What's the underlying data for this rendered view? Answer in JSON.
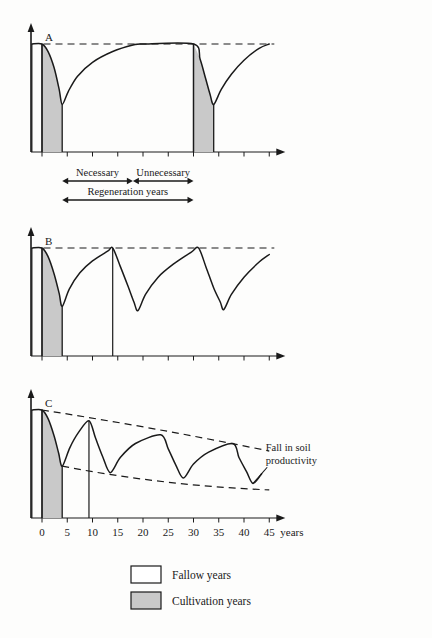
{
  "figure": {
    "title_hidden": "",
    "background_color": "#fdfdfc",
    "ink_color": "#1a1a1a",
    "cultivation_fill": "#c9c9c9"
  },
  "panels": [
    {
      "id": "A",
      "label": "A"
    },
    {
      "id": "B",
      "label": "B"
    },
    {
      "id": "C",
      "label": "C"
    }
  ],
  "annotations": {
    "necessary": "Necessary",
    "unnecessary": "Unnecessary",
    "regeneration": "Regeneration years",
    "fall_line1": "Fall in soil",
    "fall_line2": "productivity"
  },
  "axis": {
    "unit_label": "years",
    "ticks": [
      "0",
      "5",
      "10",
      "15",
      "20",
      "25",
      "30",
      "35",
      "40",
      "45"
    ],
    "tick_values": [
      0,
      5,
      10,
      15,
      20,
      25,
      30,
      35,
      40,
      45
    ]
  },
  "legend": {
    "items": [
      {
        "label": "Fallow  years",
        "swatch": "#ffffff"
      },
      {
        "label": "Cultivation  years",
        "swatch": "#c9c9c9"
      }
    ]
  },
  "chart_data": {
    "type": "line",
    "xlabel": "years",
    "ylabel": "Soil productivity",
    "xlim": [
      -2,
      47
    ],
    "ylim": [
      0,
      1.05
    ],
    "grid": false,
    "legend_position": "bottom-center",
    "panels": [
      {
        "id": "A",
        "label": "A",
        "description": "Long fallow: full regeneration reached well before the next cultivation, so part of the fallow is unnecessary.",
        "cultivation_spans": [
          [
            0,
            4
          ],
          [
            30,
            34
          ]
        ],
        "max_level_dashed_y": 1.0,
        "series": [
          {
            "name": "soil productivity",
            "points": [
              {
                "x": -2.0,
                "y": 1.0
              },
              {
                "x": 0.0,
                "y": 1.0
              },
              {
                "x": 1.2,
                "y": 0.93
              },
              {
                "x": 2.4,
                "y": 0.78
              },
              {
                "x": 3.4,
                "y": 0.58
              },
              {
                "x": 4.0,
                "y": 0.44
              },
              {
                "x": 5.2,
                "y": 0.56
              },
              {
                "x": 7.0,
                "y": 0.7
              },
              {
                "x": 10.0,
                "y": 0.83
              },
              {
                "x": 14.0,
                "y": 0.93
              },
              {
                "x": 18.0,
                "y": 0.99
              },
              {
                "x": 20.0,
                "y": 1.0
              },
              {
                "x": 30.0,
                "y": 1.0
              },
              {
                "x": 31.3,
                "y": 0.86
              },
              {
                "x": 32.4,
                "y": 0.68
              },
              {
                "x": 33.3,
                "y": 0.53
              },
              {
                "x": 34.0,
                "y": 0.44
              },
              {
                "x": 35.5,
                "y": 0.58
              },
              {
                "x": 37.5,
                "y": 0.72
              },
              {
                "x": 40.0,
                "y": 0.85
              },
              {
                "x": 43.0,
                "y": 0.96
              },
              {
                "x": 45.0,
                "y": 1.0
              }
            ]
          }
        ],
        "vertical_markers": [
          0,
          30
        ],
        "spans": [
          {
            "name": "Necessary",
            "from": 4,
            "to": 18
          },
          {
            "name": "Unnecessary",
            "from": 18,
            "to": 30
          },
          {
            "name": "Regeneration years",
            "from": 4,
            "to": 30
          }
        ]
      },
      {
        "id": "B",
        "label": "B",
        "description": "Optimum fallow: each cycle just regains full productivity before the next cultivation.",
        "cultivation_spans": [
          [
            0,
            4
          ]
        ],
        "max_level_dashed_y": 1.0,
        "series": [
          {
            "name": "soil productivity",
            "points": [
              {
                "x": -2.0,
                "y": 1.0
              },
              {
                "x": 0.0,
                "y": 1.0
              },
              {
                "x": 1.2,
                "y": 0.92
              },
              {
                "x": 2.4,
                "y": 0.76
              },
              {
                "x": 3.4,
                "y": 0.58
              },
              {
                "x": 4.0,
                "y": 0.46
              },
              {
                "x": 5.4,
                "y": 0.62
              },
              {
                "x": 7.5,
                "y": 0.77
              },
              {
                "x": 10.0,
                "y": 0.88
              },
              {
                "x": 13.0,
                "y": 0.97
              },
              {
                "x": 14.0,
                "y": 1.0
              },
              {
                "x": 15.5,
                "y": 0.83
              },
              {
                "x": 17.0,
                "y": 0.65
              },
              {
                "x": 18.2,
                "y": 0.5
              },
              {
                "x": 19.0,
                "y": 0.42
              },
              {
                "x": 20.5,
                "y": 0.57
              },
              {
                "x": 23.0,
                "y": 0.73
              },
              {
                "x": 26.0,
                "y": 0.85
              },
              {
                "x": 29.5,
                "y": 0.96
              },
              {
                "x": 31.0,
                "y": 1.0
              },
              {
                "x": 32.5,
                "y": 0.82
              },
              {
                "x": 34.0,
                "y": 0.63
              },
              {
                "x": 35.3,
                "y": 0.5
              },
              {
                "x": 36.0,
                "y": 0.43
              },
              {
                "x": 37.5,
                "y": 0.57
              },
              {
                "x": 40.0,
                "y": 0.73
              },
              {
                "x": 43.0,
                "y": 0.87
              },
              {
                "x": 45.0,
                "y": 0.94
              }
            ]
          }
        ],
        "vertical_markers": [
          0,
          14
        ]
      },
      {
        "id": "C",
        "label": "C",
        "description": "Too-short fallow: productivity never fully recovers, so both peaks and troughs decline over time.",
        "cultivation_spans": [
          [
            0,
            4
          ]
        ],
        "envelope_upper": [
          {
            "x": 0,
            "y": 1.0
          },
          {
            "x": 45,
            "y": 0.62
          }
        ],
        "envelope_lower": [
          {
            "x": 4,
            "y": 0.48
          },
          {
            "x": 45,
            "y": 0.26
          }
        ],
        "series": [
          {
            "name": "soil productivity",
            "points": [
              {
                "x": -2.0,
                "y": 1.0
              },
              {
                "x": 0.0,
                "y": 1.0
              },
              {
                "x": 1.2,
                "y": 0.92
              },
              {
                "x": 2.4,
                "y": 0.76
              },
              {
                "x": 3.3,
                "y": 0.6
              },
              {
                "x": 4.0,
                "y": 0.48
              },
              {
                "x": 5.5,
                "y": 0.65
              },
              {
                "x": 7.2,
                "y": 0.79
              },
              {
                "x": 9.3,
                "y": 0.9
              },
              {
                "x": 10.6,
                "y": 0.74
              },
              {
                "x": 12.0,
                "y": 0.57
              },
              {
                "x": 13.5,
                "y": 0.42
              },
              {
                "x": 15.5,
                "y": 0.56
              },
              {
                "x": 18.5,
                "y": 0.69
              },
              {
                "x": 23.5,
                "y": 0.77
              },
              {
                "x": 25.0,
                "y": 0.64
              },
              {
                "x": 26.5,
                "y": 0.49
              },
              {
                "x": 28.0,
                "y": 0.37
              },
              {
                "x": 30.0,
                "y": 0.5
              },
              {
                "x": 33.0,
                "y": 0.61
              },
              {
                "x": 37.8,
                "y": 0.69
              },
              {
                "x": 39.0,
                "y": 0.56
              },
              {
                "x": 40.5,
                "y": 0.43
              },
              {
                "x": 41.8,
                "y": 0.32
              },
              {
                "x": 43.5,
                "y": 0.41
              }
            ]
          }
        ],
        "vertical_markers": [
          0,
          9.3
        ],
        "callout": {
          "text": [
            "Fall in soil",
            "productivity"
          ],
          "at_x": 44.5
        }
      }
    ]
  }
}
